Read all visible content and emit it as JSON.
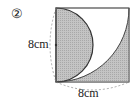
{
  "problem_number": "②",
  "labels": {
    "left_side": "8cm",
    "bottom_side": "8cm"
  },
  "colors": {
    "shade": "#b8b8b8",
    "line": "#333333",
    "dash": "#888888"
  }
}
